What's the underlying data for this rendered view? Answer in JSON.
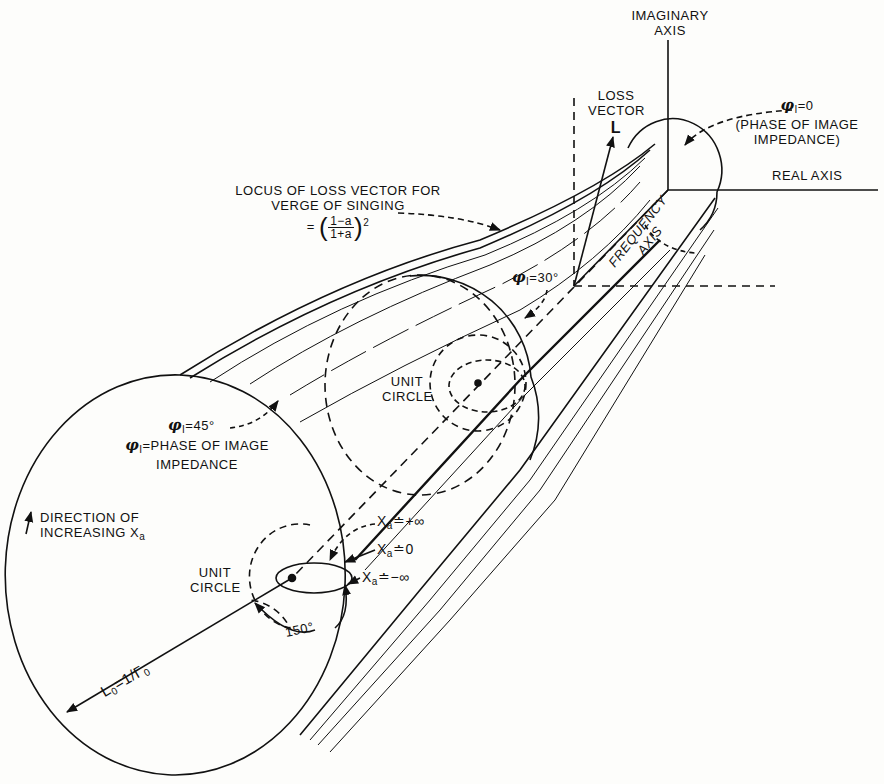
{
  "diagram": {
    "type": "3d-geometric-figure"
  },
  "labels": {
    "imaginary_axis": [
      "IMAGINARY",
      "AXIS"
    ],
    "real_axis": "REAL AXIS",
    "loss_vector": [
      "LOSS",
      "VECTOR",
      "L"
    ],
    "phi_zero": {
      "symbol": "φ",
      "subscript": "I",
      "value": "=0",
      "note_line1": "(PHASE OF IMAGE",
      "note_line2": "IMPEDANCE)"
    },
    "locus": {
      "line1": "LOCUS OF LOSS VECTOR FOR",
      "line2": "VERGE OF SINGING",
      "equals": "=",
      "numerator": "1−a",
      "denominator": "1+a",
      "exponent": "2"
    },
    "frequency_axis": [
      "FREQUENCY",
      "AXIS"
    ],
    "phi_30": {
      "symbol": "φ",
      "subscript": "I",
      "value": "=30°"
    },
    "unit_circle_upper": [
      "UNIT",
      "CIRCLE"
    ],
    "phi_45": {
      "symbol": "φ",
      "subscript": "I",
      "value": "=45°"
    },
    "phi_definition": {
      "symbol": "φ",
      "subscript": "I",
      "line1": "=PHASE OF IMAGE",
      "line2": "IMPEDANCE"
    },
    "direction": {
      "line1": "DIRECTION OF",
      "line2": "INCREASING X",
      "subscript": "a"
    },
    "unit_circle_lower": [
      "UNIT",
      "CIRCLE"
    ],
    "xa_plus_inf": {
      "var": "X",
      "sub": "a",
      "value": "≐+∞"
    },
    "xa_zero": {
      "var": "X",
      "sub": "a",
      "value": "≐0"
    },
    "xa_minus_inf": {
      "var": "X",
      "sub": "a",
      "value": "≐−∞"
    },
    "angle_150": "150°",
    "l0": {
      "var": "L",
      "sub": "0",
      "value": "=1/Γ",
      "sub2": "0"
    }
  },
  "colors": {
    "ink": "#111111",
    "paper": "#fdfdfb"
  }
}
